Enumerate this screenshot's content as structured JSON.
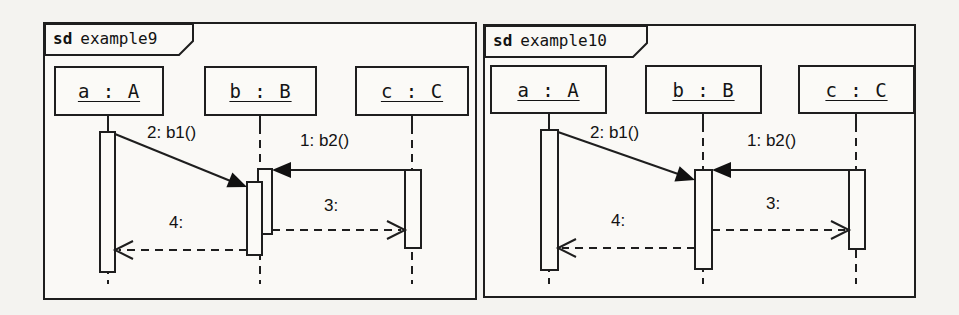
{
  "colors": {
    "ink": "#1e1e1e",
    "paper": "#faf9f6"
  },
  "diagrams": [
    {
      "frame_label": {
        "keyword": "sd",
        "name": "example9"
      },
      "lifelines": [
        {
          "label": "a : A"
        },
        {
          "label": "b : B"
        },
        {
          "label": "c : C"
        }
      ],
      "messages": [
        {
          "label": "1: b2()",
          "kind": "sync-call-solid-filled-arrow",
          "from": "c",
          "to": "b"
        },
        {
          "label": "2: b1()",
          "kind": "sync-call-solid-filled-arrow",
          "from": "a",
          "to": "b"
        },
        {
          "label": "3:",
          "kind": "reply-dashed-open-arrow",
          "from": "b",
          "to": "c"
        },
        {
          "label": "4:",
          "kind": "reply-dashed-open-arrow",
          "from": "b",
          "to": "a"
        }
      ],
      "note": "two overlapping activation bars on b"
    },
    {
      "frame_label": {
        "keyword": "sd",
        "name": "example10"
      },
      "lifelines": [
        {
          "label": "a : A"
        },
        {
          "label": "b : B"
        },
        {
          "label": "c : C"
        }
      ],
      "messages": [
        {
          "label": "1: b2()",
          "kind": "sync-call-solid-filled-arrow",
          "from": "c",
          "to": "b"
        },
        {
          "label": "2: b1()",
          "kind": "sync-call-solid-filled-arrow",
          "from": "a",
          "to": "b"
        },
        {
          "label": "3:",
          "kind": "reply-dashed-open-arrow",
          "from": "b",
          "to": "c"
        },
        {
          "label": "4:",
          "kind": "reply-dashed-open-arrow",
          "from": "b",
          "to": "a"
        }
      ],
      "note": "single merged activation bar on b"
    }
  ]
}
